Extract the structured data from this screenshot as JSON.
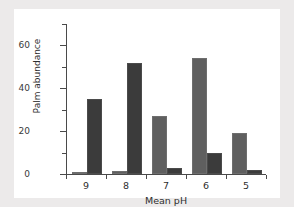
{
  "chart_data": {
    "type": "bar",
    "title": "",
    "xlabel": "Mean pH",
    "ylabel": "Palm abundance",
    "categories": [
      "9",
      "8",
      "7",
      "6",
      "5"
    ],
    "series": [
      {
        "name": "series-a",
        "color": "#5f5f5f",
        "values": [
          0.5,
          1.5,
          27,
          54,
          19
        ]
      },
      {
        "name": "series-b",
        "color": "#3b3b3b",
        "values": [
          35,
          52,
          3,
          10,
          2
        ]
      }
    ],
    "ylim": [
      0,
      70
    ],
    "y_ticks_major": [
      0,
      20,
      40,
      60
    ],
    "y_tick_labels": [
      "0",
      "20",
      "40",
      "60"
    ],
    "y_ticks_minor": [
      10,
      30,
      50,
      70
    ],
    "grid": false,
    "legend": "none"
  },
  "figure": {
    "background_color": "#ffffff",
    "page_background_color": "#eceaea",
    "axis_color": "#4a4a4a"
  }
}
